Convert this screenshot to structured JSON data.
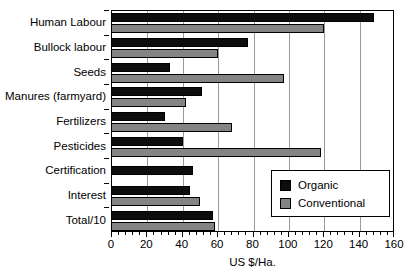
{
  "chart_data": {
    "type": "bar",
    "orientation": "horizontal",
    "title": "",
    "xlabel": "US $/Ha.",
    "ylabel": "",
    "xlim": [
      0,
      160
    ],
    "xticks": [
      0,
      20,
      40,
      60,
      80,
      100,
      120,
      140,
      160
    ],
    "xtick_labels": [
      "0",
      "20",
      "40",
      "60",
      "80",
      "100",
      "120",
      "140",
      "160"
    ],
    "grid": true,
    "grid_axis": "x",
    "legend_position": "lower right",
    "categories": [
      "Human Labour",
      "Bullock labour",
      "Seeds",
      "Manures (farmyard)",
      "Fertilizers",
      "Pesticides",
      "Certification",
      "Interest",
      "Total/10"
    ],
    "series": [
      {
        "name": "Organic",
        "color": "#0d0d0d",
        "values": [
          148,
          77,
          33,
          51,
          30,
          40,
          46,
          44,
          57
        ]
      },
      {
        "name": "Conventional",
        "color": "#848484",
        "values": [
          120,
          60,
          97,
          42,
          68,
          118,
          null,
          50,
          58
        ]
      }
    ]
  },
  "legend": {
    "entries": [
      {
        "label": "Organic",
        "swatch": "organic"
      },
      {
        "label": "Conventional",
        "swatch": "conventional"
      }
    ]
  },
  "axis": {
    "x_title": "US $/Ha."
  },
  "colors": {
    "organic": "#0d0d0d",
    "conventional": "#848484",
    "axis": "#000000",
    "grid": "#9a9a9a",
    "background": "#ffffff"
  }
}
